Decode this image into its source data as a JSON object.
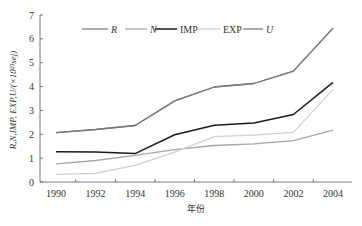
{
  "chart_data": {
    "type": "line",
    "title": "",
    "xlabel": "年份",
    "ylabel": "R,N,IMP, EXP,U/(×10²³sej)",
    "x": [
      1990,
      1992,
      1994,
      1996,
      1998,
      2000,
      2002,
      2004
    ],
    "xticks": [
      "1990",
      "1992",
      "1994",
      "1996",
      "1998",
      "2000",
      "2002",
      "2004"
    ],
    "yticks": [
      "0",
      "1",
      "2",
      "3",
      "4",
      "5",
      "6",
      "7"
    ],
    "ylim": [
      0,
      7
    ],
    "grid": false,
    "legend_position": "top-inside",
    "series": [
      {
        "name": "R",
        "italic": true,
        "color": "#808080",
        "width": 1.3,
        "values": [
          2.07,
          2.2,
          2.37,
          3.4,
          3.98,
          4.13,
          4.65,
          6.45
        ]
      },
      {
        "name": "N",
        "italic": true,
        "color": "#a6a6a6",
        "width": 1.3,
        "values": [
          0.76,
          0.9,
          1.12,
          1.36,
          1.53,
          1.6,
          1.73,
          2.17
        ]
      },
      {
        "name": "IMP",
        "italic": false,
        "color": "#1a1a1a",
        "width": 1.5,
        "values": [
          1.27,
          1.26,
          1.19,
          1.98,
          2.38,
          2.47,
          2.83,
          4.18
        ]
      },
      {
        "name": "EXP",
        "italic": false,
        "color": "#cfcfcf",
        "width": 1.3,
        "values": [
          0.32,
          0.36,
          0.7,
          1.25,
          1.9,
          1.96,
          2.08,
          3.88
        ]
      },
      {
        "name": "U",
        "italic": true,
        "color": "#7a7a7a",
        "width": 1.3,
        "values": [
          2.07,
          2.2,
          2.37,
          3.4,
          3.98,
          4.13,
          4.65,
          6.45
        ]
      }
    ]
  }
}
